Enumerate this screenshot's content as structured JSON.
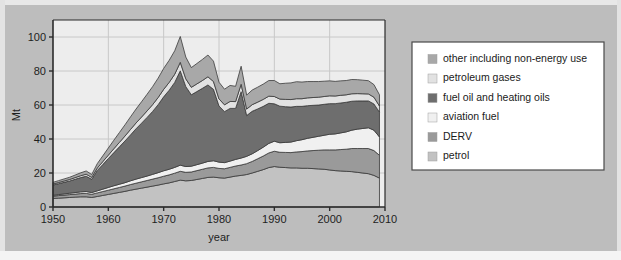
{
  "figure": {
    "background_color": "#bdbdbd",
    "plot_background_color": "#ededed",
    "grid_color": "#c8c8c8",
    "axis_color": "#2b2b2b",
    "series_outline_color": "#3a3a3a"
  },
  "chart_data": {
    "type": "area",
    "stacked": true,
    "title": "",
    "xlabel": "year",
    "ylabel": "Mt",
    "xlim": [
      1950,
      2010
    ],
    "ylim": [
      0,
      110
    ],
    "xticks": [
      1950,
      1960,
      1970,
      1980,
      1990,
      2000,
      2010
    ],
    "yticks": [
      0,
      20,
      40,
      60,
      80,
      100
    ],
    "grid": true,
    "legend_position": "right",
    "x": [
      1950,
      1951,
      1952,
      1953,
      1954,
      1955,
      1956,
      1957,
      1958,
      1959,
      1960,
      1961,
      1962,
      1963,
      1964,
      1965,
      1966,
      1967,
      1968,
      1969,
      1970,
      1971,
      1972,
      1973,
      1974,
      1975,
      1976,
      1977,
      1978,
      1979,
      1980,
      1981,
      1982,
      1983,
      1984,
      1985,
      1986,
      1987,
      1988,
      1989,
      1990,
      1991,
      1992,
      1993,
      1994,
      1995,
      1996,
      1997,
      1998,
      1999,
      2000,
      2001,
      2002,
      2003,
      2004,
      2005,
      2006,
      2007,
      2008,
      2009
    ],
    "series": [
      {
        "name": "petrol",
        "color": "#c2c2c2",
        "values": [
          5.0,
          5.2,
          5.4,
          5.6,
          5.8,
          6.0,
          6.0,
          5.6,
          6.2,
          6.8,
          7.4,
          8.0,
          8.6,
          9.2,
          9.9,
          10.5,
          11.1,
          11.7,
          12.3,
          12.9,
          13.6,
          14.2,
          15.0,
          15.8,
          15.4,
          15.6,
          16.2,
          16.8,
          17.4,
          17.6,
          17.2,
          17.0,
          17.6,
          18.2,
          18.6,
          19.1,
          20.0,
          21.0,
          22.0,
          23.2,
          23.8,
          23.4,
          23.2,
          23.0,
          23.0,
          22.8,
          22.8,
          22.6,
          22.4,
          22.2,
          21.8,
          21.4,
          21.2,
          21.0,
          20.8,
          20.4,
          20.0,
          19.6,
          18.6,
          17.0
        ]
      },
      {
        "name": "DERV",
        "color": "#9a9a9a",
        "values": [
          1.4,
          1.5,
          1.6,
          1.7,
          1.8,
          1.9,
          2.0,
          1.9,
          2.1,
          2.3,
          2.5,
          2.7,
          2.9,
          3.1,
          3.3,
          3.5,
          3.7,
          3.9,
          4.1,
          4.3,
          4.5,
          4.7,
          4.9,
          5.2,
          5.0,
          5.0,
          5.2,
          5.4,
          5.6,
          5.7,
          5.5,
          5.5,
          5.7,
          5.9,
          6.1,
          6.4,
          6.8,
          7.4,
          8.0,
          8.6,
          9.0,
          8.8,
          8.9,
          9.0,
          9.4,
          9.8,
          10.2,
          10.6,
          11.0,
          11.4,
          11.8,
          12.2,
          12.6,
          13.0,
          13.6,
          14.0,
          14.4,
          14.8,
          14.6,
          13.4
        ]
      },
      {
        "name": "aviation fuel",
        "color": "#f0f0f0",
        "values": [
          0.5,
          0.6,
          0.7,
          0.8,
          0.9,
          1.0,
          1.1,
          1.0,
          1.2,
          1.4,
          1.6,
          1.8,
          1.9,
          2.0,
          2.2,
          2.4,
          2.5,
          2.6,
          2.8,
          3.0,
          3.2,
          3.3,
          3.4,
          3.6,
          3.4,
          3.4,
          3.5,
          3.6,
          3.8,
          3.9,
          3.7,
          3.6,
          3.7,
          3.9,
          4.1,
          4.3,
          4.5,
          4.8,
          5.2,
          5.6,
          5.9,
          5.6,
          5.9,
          6.2,
          6.6,
          7.0,
          7.4,
          7.8,
          8.2,
          8.6,
          9.2,
          9.4,
          9.8,
          10.2,
          10.8,
          11.4,
          11.8,
          12.2,
          12.0,
          10.8
        ]
      },
      {
        "name": "fuel oil and heating oils",
        "color": "#6e6e6e",
        "values": [
          6.0,
          6.4,
          6.8,
          7.2,
          7.8,
          8.4,
          9.0,
          7.8,
          12.0,
          14.5,
          17.0,
          19.5,
          22.0,
          24.5,
          27.0,
          29.6,
          32.0,
          34.5,
          37.0,
          40.0,
          43.5,
          46.5,
          50.0,
          55.5,
          47.0,
          42.0,
          43.0,
          44.0,
          45.0,
          42.0,
          33.0,
          30.0,
          31.0,
          30.0,
          39.0,
          24.0,
          25.0,
          24.5,
          24.0,
          23.6,
          22.0,
          21.5,
          21.0,
          20.6,
          20.2,
          19.6,
          19.2,
          18.8,
          18.4,
          18.2,
          18.0,
          17.8,
          17.6,
          17.4,
          17.0,
          16.6,
          16.2,
          15.8,
          15.4,
          14.6
        ]
      },
      {
        "name": "petroleum gases",
        "color": "#e2e2e2",
        "values": [
          0.6,
          0.7,
          0.8,
          0.9,
          1.0,
          1.1,
          1.2,
          1.1,
          1.4,
          1.7,
          2.0,
          2.3,
          2.6,
          2.9,
          3.2,
          3.4,
          3.6,
          3.8,
          4.0,
          4.2,
          4.4,
          4.6,
          4.8,
          5.0,
          4.6,
          4.4,
          4.5,
          4.6,
          4.8,
          4.6,
          4.2,
          4.0,
          4.1,
          4.0,
          4.4,
          3.8,
          3.9,
          4.0,
          4.1,
          4.2,
          4.3,
          4.2,
          4.3,
          4.4,
          4.5,
          4.5,
          4.6,
          4.6,
          4.6,
          4.6,
          4.6,
          4.5,
          4.5,
          4.4,
          4.4,
          4.3,
          4.2,
          4.1,
          4.0,
          3.6
        ]
      },
      {
        "name": "other including non-energy use",
        "color": "#a8a8a8",
        "values": [
          1.0,
          1.1,
          1.2,
          1.3,
          1.5,
          1.7,
          1.9,
          1.7,
          2.6,
          3.4,
          4.2,
          5.0,
          5.8,
          6.6,
          7.4,
          8.2,
          9.0,
          9.8,
          10.6,
          11.4,
          12.3,
          13.0,
          13.8,
          15.2,
          12.8,
          11.6,
          12.0,
          12.4,
          12.8,
          12.0,
          9.8,
          9.2,
          9.4,
          9.0,
          10.6,
          8.2,
          8.6,
          8.8,
          9.0,
          9.2,
          9.4,
          9.0,
          9.5,
          9.8,
          10.0,
          9.8,
          9.6,
          9.4,
          9.2,
          9.0,
          8.8,
          8.6,
          8.5,
          8.4,
          8.4,
          8.2,
          8.0,
          7.8,
          7.4,
          6.6
        ]
      }
    ]
  },
  "legend": {
    "items": [
      {
        "label": "other including non-energy use",
        "color": "#a8a8a8"
      },
      {
        "label": "petroleum gases",
        "color": "#e2e2e2"
      },
      {
        "label": "fuel oil and heating oils",
        "color": "#6e6e6e"
      },
      {
        "label": "aviation fuel",
        "color": "#f0f0f0"
      },
      {
        "label": "DERV",
        "color": "#9a9a9a"
      },
      {
        "label": "petrol",
        "color": "#c2c2c2"
      }
    ]
  }
}
